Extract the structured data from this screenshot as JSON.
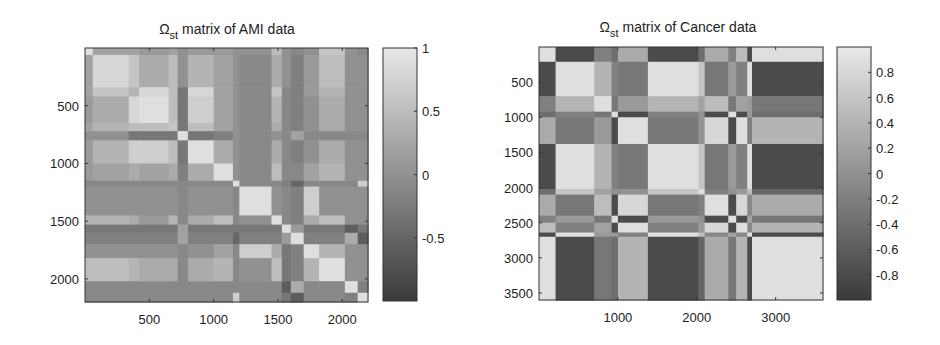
{
  "chart_data": [
    {
      "type": "heatmap",
      "title": "Ω_st matrix of AMI data",
      "title_main": "Ω",
      "title_sub": "st",
      "title_rest": " matrix of AMI data",
      "xlabel": "",
      "ylabel": "",
      "xlim": [
        0,
        2200
      ],
      "ylim": [
        2200,
        0
      ],
      "xticks": [
        500,
        1000,
        1500,
        2000
      ],
      "yticks": [
        500,
        1000,
        1500,
        2000
      ],
      "colorbar": {
        "range": [
          -1,
          1
        ],
        "ticks": [
          "1",
          "0.5",
          "0",
          "-0.5"
        ],
        "tick_values": [
          1,
          0.5,
          0,
          -0.5
        ],
        "colormap": "gray"
      },
      "grid": false,
      "blocks": [
        0,
        60,
        340,
        420,
        650,
        720,
        800,
        1000,
        1150,
        1200,
        1450,
        1530,
        1600,
        1700,
        1820,
        2020,
        2120,
        2200
      ],
      "block_values": [
        [
          0.9,
          0.2,
          0.2,
          0.1,
          0.2,
          0.0,
          0.1,
          0.1,
          0.0,
          0.0,
          0.5,
          0.0,
          -0.1,
          0.0,
          0.6,
          0.0,
          -0.1
        ],
        [
          0.2,
          0.8,
          0.6,
          0.3,
          0.5,
          0.0,
          0.4,
          0.2,
          0.0,
          -0.1,
          0.3,
          0.0,
          -0.2,
          0.1,
          0.5,
          0.0,
          0.0
        ],
        [
          0.2,
          0.6,
          0.4,
          0.8,
          0.5,
          -0.3,
          0.8,
          0.2,
          0.0,
          -0.1,
          0.6,
          -0.1,
          -0.2,
          0.1,
          0.4,
          0.0,
          0.0
        ],
        [
          0.1,
          0.3,
          0.8,
          0.9,
          0.5,
          -0.3,
          0.7,
          0.2,
          0.0,
          -0.1,
          0.4,
          -0.1,
          -0.2,
          0.0,
          0.3,
          0.0,
          0.0
        ],
        [
          0.2,
          0.4,
          0.5,
          0.5,
          0.6,
          -0.3,
          0.5,
          0.2,
          0.0,
          -0.1,
          0.3,
          -0.1,
          -0.2,
          0.0,
          0.3,
          0.0,
          0.0
        ],
        [
          0.0,
          0.0,
          -0.3,
          -0.3,
          -0.3,
          0.9,
          -0.3,
          -0.2,
          0.0,
          -0.1,
          0.0,
          -0.1,
          0.2,
          -0.1,
          -0.1,
          -0.1,
          -0.1
        ],
        [
          0.1,
          0.4,
          0.7,
          0.7,
          0.5,
          -0.3,
          0.9,
          0.3,
          0.0,
          -0.1,
          0.3,
          -0.1,
          -0.2,
          0.0,
          0.3,
          0.0,
          0.0
        ],
        [
          0.1,
          0.2,
          0.3,
          0.2,
          0.3,
          -0.2,
          0.3,
          0.9,
          0.0,
          -0.1,
          0.5,
          -0.1,
          -0.1,
          0.2,
          0.4,
          0.0,
          0.0
        ],
        [
          -0.1,
          -0.1,
          -0.1,
          -0.1,
          -0.1,
          -0.1,
          -0.1,
          -0.1,
          0.9,
          -0.1,
          -0.1,
          -0.2,
          -0.5,
          -0.1,
          -0.1,
          -0.1,
          0.7
        ],
        [
          0.0,
          0.0,
          0.0,
          0.0,
          0.0,
          -0.1,
          0.0,
          0.0,
          -0.1,
          0.9,
          0.0,
          -0.1,
          -0.2,
          0.7,
          0.0,
          0.0,
          0.0
        ],
        [
          0.4,
          0.4,
          0.3,
          0.1,
          0.4,
          -0.1,
          0.3,
          0.5,
          -0.1,
          0.0,
          0.9,
          -0.1,
          -0.2,
          0.3,
          0.5,
          0.0,
          0.0
        ],
        [
          -0.3,
          -0.3,
          -0.3,
          -0.3,
          -0.3,
          0.2,
          -0.3,
          -0.3,
          -0.3,
          -0.3,
          -0.3,
          0.9,
          0.1,
          -0.3,
          -0.3,
          -0.6,
          -0.3
        ],
        [
          -0.2,
          -0.2,
          -0.2,
          -0.2,
          -0.2,
          0.2,
          -0.2,
          -0.2,
          -0.5,
          -0.2,
          -0.2,
          0.1,
          0.9,
          -0.2,
          -0.2,
          0.3,
          -0.6
        ],
        [
          0.0,
          0.0,
          0.0,
          0.0,
          0.0,
          -0.1,
          0.0,
          0.2,
          -0.1,
          0.7,
          0.3,
          -0.3,
          -0.2,
          0.9,
          0.4,
          0.0,
          0.0
        ],
        [
          0.5,
          0.5,
          0.4,
          0.3,
          0.3,
          -0.1,
          0.3,
          0.4,
          -0.1,
          0.0,
          0.5,
          -0.3,
          -0.2,
          0.4,
          0.9,
          0.0,
          0.0
        ],
        [
          -0.1,
          -0.1,
          -0.1,
          -0.1,
          -0.1,
          -0.1,
          -0.1,
          -0.1,
          -0.1,
          -0.1,
          -0.1,
          -0.6,
          0.3,
          -0.1,
          -0.1,
          0.9,
          -0.2
        ],
        [
          -0.1,
          -0.1,
          -0.1,
          -0.1,
          -0.1,
          -0.1,
          -0.1,
          -0.1,
          0.7,
          -0.1,
          -0.1,
          -0.3,
          -0.6,
          -0.1,
          -0.1,
          -0.2,
          0.9
        ]
      ]
    },
    {
      "type": "heatmap",
      "title": "Ω_st matrix of Cancer data",
      "title_main": "Ω",
      "title_sub": "st",
      "title_rest": " matrix of Cancer data",
      "xlabel": "",
      "ylabel": "",
      "xlim": [
        0,
        3600
      ],
      "ylim": [
        3600,
        0
      ],
      "xticks": [
        1000,
        2000,
        3000
      ],
      "yticks": [
        500,
        1000,
        1500,
        2000,
        2500,
        3000,
        3500
      ],
      "colorbar": {
        "range": [
          -1,
          1
        ],
        "ticks": [
          "0.8",
          "0.6",
          "0.4",
          "0.2",
          "0",
          "-0.2",
          "-0.4",
          "-0.6",
          "-0.8"
        ],
        "tick_values": [
          0.8,
          0.6,
          0.4,
          0.2,
          0,
          -0.2,
          -0.4,
          -0.6,
          -0.8
        ],
        "colormap": "gray"
      },
      "grid": false,
      "blocks": [
        0,
        210,
        700,
        920,
        1000,
        1380,
        2020,
        2100,
        2400,
        2500,
        2640,
        2700,
        3600
      ],
      "block_values": [
        [
          0.9,
          -0.8,
          -0.2,
          -0.4,
          0.3,
          -0.8,
          -0.4,
          0.3,
          -0.2,
          0.5,
          -0.8,
          0.9
        ],
        [
          -0.8,
          0.9,
          0.4,
          -0.2,
          -0.3,
          0.9,
          0.6,
          -0.3,
          0.1,
          -0.2,
          0.9,
          -0.8
        ],
        [
          -0.2,
          0.4,
          0.9,
          -0.3,
          0.1,
          0.4,
          0.2,
          0.5,
          -0.3,
          0.2,
          0.1,
          -0.3
        ],
        [
          -0.4,
          -0.2,
          -0.3,
          0.9,
          -0.8,
          -0.2,
          0.0,
          -0.8,
          0.9,
          -0.8,
          0.1,
          -0.4
        ],
        [
          0.3,
          -0.3,
          0.1,
          -0.8,
          0.9,
          -0.3,
          0.0,
          0.8,
          -0.8,
          0.9,
          -0.2,
          0.4
        ],
        [
          -0.8,
          0.9,
          0.4,
          -0.2,
          -0.3,
          0.9,
          0.6,
          -0.3,
          0.1,
          -0.2,
          0.9,
          -0.8
        ],
        [
          -0.4,
          0.6,
          0.2,
          0.0,
          0.0,
          0.6,
          0.9,
          -0.2,
          0.0,
          0.1,
          0.5,
          -0.5
        ],
        [
          0.3,
          -0.3,
          0.5,
          -0.8,
          0.8,
          -0.3,
          -0.2,
          0.9,
          -0.8,
          0.8,
          -0.1,
          0.3
        ],
        [
          -0.2,
          0.1,
          -0.3,
          0.9,
          -0.8,
          0.1,
          0.0,
          -0.8,
          0.9,
          -0.8,
          0.2,
          -0.3
        ],
        [
          0.5,
          -0.2,
          0.2,
          -0.8,
          0.9,
          -0.2,
          0.1,
          0.8,
          -0.8,
          0.9,
          -0.1,
          0.4
        ],
        [
          -0.8,
          0.9,
          0.1,
          0.1,
          -0.2,
          0.9,
          0.5,
          -0.1,
          0.2,
          -0.1,
          0.9,
          -0.8
        ],
        [
          0.9,
          -0.8,
          -0.3,
          -0.4,
          0.4,
          -0.8,
          -0.5,
          0.3,
          -0.3,
          0.4,
          -0.8,
          0.9
        ]
      ]
    }
  ]
}
